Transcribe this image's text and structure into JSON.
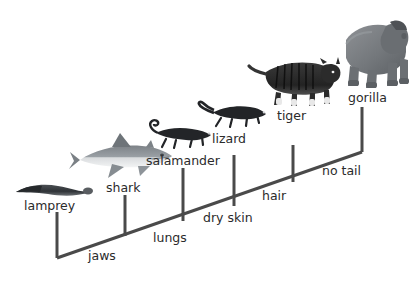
{
  "diagram": {
    "type": "cladogram",
    "background_color": "#ffffff",
    "line_color": "#4a4a4a",
    "text_color": "#2b2b2b",
    "taxa": [
      {
        "id": "lamprey",
        "label": "lamprey",
        "branch_x": 57,
        "branch_top": 212,
        "branch_bottom": 258,
        "label_x": 24,
        "label_y": 200,
        "icon": "lamprey-silhouette",
        "icon_x": 14,
        "icon_y": 180,
        "icon_w": 78,
        "icon_h": 18
      },
      {
        "id": "shark",
        "label": "shark",
        "branch_x": 125,
        "branch_top": 195,
        "branch_bottom": 236,
        "label_x": 106,
        "label_y": 182,
        "icon": "shark-silhouette",
        "icon_x": 78,
        "icon_y": 133,
        "icon_w": 94,
        "icon_h": 46
      },
      {
        "id": "salamander",
        "label": "salamander",
        "branch_x": 183,
        "branch_top": 168,
        "branch_bottom": 221,
        "label_x": 146,
        "label_y": 155,
        "icon": "salamander-silhouette",
        "icon_x": 148,
        "icon_y": 122,
        "icon_w": 70,
        "icon_h": 30
      },
      {
        "id": "lizard",
        "label": "lizard",
        "branch_x": 234,
        "branch_top": 155,
        "branch_bottom": 206,
        "label_x": 212,
        "label_y": 133,
        "icon": "lizard-silhouette",
        "icon_x": 199,
        "icon_y": 100,
        "icon_w": 68,
        "icon_h": 30
      },
      {
        "id": "tiger",
        "label": "tiger",
        "branch_x": 293,
        "branch_top": 145,
        "branch_bottom": 182,
        "label_x": 277,
        "label_y": 110,
        "icon": "tiger-photo",
        "icon_x": 250,
        "icon_y": 56,
        "icon_w": 88,
        "icon_h": 52
      },
      {
        "id": "gorilla",
        "label": "gorilla",
        "branch_x": 362,
        "branch_top": 107,
        "branch_bottom": 152,
        "label_x": 348,
        "label_y": 92,
        "icon": "gorilla-photo",
        "icon_x": 338,
        "icon_y": 14,
        "icon_w": 72,
        "icon_h": 76
      }
    ],
    "traits": [
      {
        "id": "jaws",
        "label": "jaws",
        "x": 88,
        "y": 250
      },
      {
        "id": "lungs",
        "label": "lungs",
        "x": 153,
        "y": 232
      },
      {
        "id": "dry_skin",
        "label": "dry skin",
        "x": 203,
        "y": 212
      },
      {
        "id": "hair",
        "label": "hair",
        "x": 262,
        "y": 190
      },
      {
        "id": "no_tail",
        "label": "no tail",
        "x": 322,
        "y": 165
      }
    ],
    "trunk": {
      "start_x": 57,
      "start_y": 258,
      "end_x": 362,
      "end_y": 152,
      "stroke_width": 3
    }
  }
}
